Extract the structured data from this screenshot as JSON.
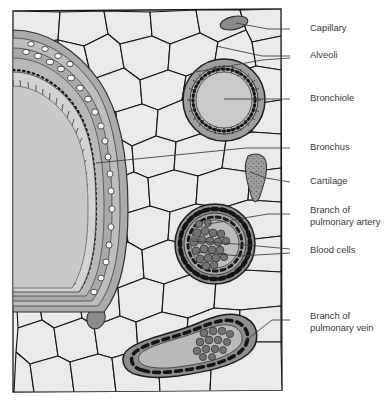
{
  "figure": {
    "panel": {
      "background_color": "#eeeeee",
      "border_color": "#1a1a1a",
      "x": 12,
      "y": 9,
      "width": 270,
      "height": 383
    },
    "palette": {
      "tissue_fill": "#eaeaea",
      "tissue_outline": "#1a1a1a",
      "lumen_gray": "#c9c9c9",
      "wall_gray": "#9a9a9a",
      "dark_gray": "#6e6e70",
      "cell_gray": "#7d7d7f",
      "label_text": "#3a3a3c",
      "leader_line": "#3a3a3c",
      "white_cell": "#ffffff"
    }
  },
  "structures": [
    {
      "id": "bronchus",
      "name": "Bronchus",
      "kind": "large-airway-cross-section"
    },
    {
      "id": "bronchiole",
      "name": "Bronchiole",
      "kind": "small-airway-ring"
    },
    {
      "id": "artery",
      "name": "Branch of pulmonary artery",
      "kind": "thick-walled-vessel"
    },
    {
      "id": "vein",
      "name": "Branch of pulmonary vein",
      "kind": "thin-walled-vessel"
    },
    {
      "id": "cartilage",
      "name": "Cartilage",
      "kind": "speckled-plate"
    },
    {
      "id": "capillary",
      "name": "Capillary",
      "kind": "small-dark-oval"
    },
    {
      "id": "alveoli",
      "name": "Alveoli",
      "kind": "polygonal-air-spaces"
    },
    {
      "id": "blood-cells",
      "name": "Blood cells",
      "kind": "round-cell-cluster"
    }
  ],
  "labels": [
    {
      "id": "capillary",
      "lines": [
        "Capillary"
      ],
      "text_x": 310,
      "text_y": 29,
      "leader": [
        [
          290,
          29
        ],
        [
          268,
          29
        ],
        [
          236,
          23
        ]
      ]
    },
    {
      "id": "alveoli",
      "lines": [
        "Alveoli"
      ],
      "text_x": 310,
      "text_y": 56,
      "leader": [
        [
          290,
          56
        ],
        [
          262,
          56
        ],
        [
          216,
          46
        ]
      ],
      "leader2": [
        [
          290,
          58
        ],
        [
          262,
          60
        ],
        [
          196,
          72
        ]
      ]
    },
    {
      "id": "bronchiole",
      "lines": [
        "Bronchiole"
      ],
      "text_x": 310,
      "text_y": 99,
      "leader": [
        [
          290,
          99
        ],
        [
          224,
          99
        ]
      ]
    },
    {
      "id": "bronchus",
      "lines": [
        "Bronchus"
      ],
      "text_x": 310,
      "text_y": 148,
      "leader": [
        [
          290,
          148
        ],
        [
          246,
          148
        ],
        [
          96,
          163
        ]
      ]
    },
    {
      "id": "cartilage",
      "lines": [
        "Cartilage"
      ],
      "text_x": 310,
      "text_y": 182,
      "leader": [
        [
          290,
          182
        ],
        [
          266,
          178
        ],
        [
          250,
          172
        ]
      ]
    },
    {
      "id": "artery",
      "lines": [
        "Branch of",
        "pulmonary artery"
      ],
      "text_x": 310,
      "text_y": 211,
      "leader": [
        [
          290,
          214
        ],
        [
          268,
          214
        ],
        [
          208,
          224
        ]
      ]
    },
    {
      "id": "blood-cells",
      "lines": [
        "Blood cells"
      ],
      "text_x": 310,
      "text_y": 251,
      "leader": [
        [
          290,
          249
        ],
        [
          236,
          244
        ],
        [
          192,
          241
        ]
      ],
      "leader2": [
        [
          290,
          253
        ],
        [
          240,
          256
        ],
        [
          196,
          252
        ]
      ]
    },
    {
      "id": "vein",
      "lines": [
        "Branch of",
        "pulmonary vein"
      ],
      "text_x": 310,
      "text_y": 317,
      "leader": [
        [
          290,
          320
        ],
        [
          272,
          320
        ],
        [
          244,
          342
        ]
      ]
    }
  ]
}
